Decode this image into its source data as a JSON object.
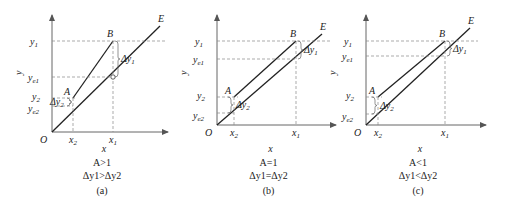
{
  "figure": {
    "panels": [
      {
        "id": "a",
        "origin": [
          52,
          132
        ],
        "axis_top": 15,
        "axis_right": 168,
        "O": [
          52,
          132
        ],
        "A": [
          73,
          98
        ],
        "B": [
          113,
          41
        ],
        "E_end": [
          160,
          26
        ],
        "x2": 73,
        "x1": 113,
        "y1": 41,
        "ye1": 77,
        "y2": 98,
        "ye2": 106,
        "line_AB_separate": true,
        "labels": {
          "y_axis": "y",
          "x_axis": "x",
          "O": "O",
          "A": "A",
          "B": "B",
          "E": "E",
          "y1": "y",
          "y1_sub": "1",
          "ye1": "y",
          "ye1_sub": "e1",
          "y2": "y",
          "y2_sub": "2",
          "ye2": "y",
          "ye2_sub": "e2",
          "x1": "x",
          "x1_sub": "1",
          "x2": "x",
          "x2_sub": "2",
          "dy1": "Δy",
          "dy1_sub": "1",
          "dy2": "Δy",
          "dy2_sub": "2"
        },
        "caption_condition": "A>1",
        "caption_relation": "Δy1>Δy2",
        "caption_tag": "(a)"
      },
      {
        "id": "b",
        "origin": [
          217,
          125
        ],
        "axis_top": 15,
        "axis_right": 336,
        "O": [
          217,
          125
        ],
        "A": [
          234,
          97
        ],
        "B": [
          296,
          41
        ],
        "E_end": [
          322,
          34
        ],
        "x2": 234,
        "x1": 296,
        "y1": 41,
        "ye1": 59,
        "y2": 97,
        "ye2": 113,
        "labels": {
          "y_axis": "y",
          "x_axis": "x",
          "O": "O",
          "A": "A",
          "B": "B",
          "E": "E",
          "y1": "y",
          "y1_sub": "1",
          "ye1": "y",
          "ye1_sub": "e1",
          "y2": "y",
          "y2_sub": "2",
          "ye2": "y",
          "ye2_sub": "e2",
          "x1": "x",
          "x1_sub": "1",
          "x2": "x",
          "x2_sub": "2",
          "dy1": "Δy",
          "dy1_sub": "1",
          "dy2": "Δy",
          "dy2_sub": "2"
        },
        "caption_condition": "A=1",
        "caption_relation": "Δy1=Δy2",
        "caption_tag": "(b)"
      },
      {
        "id": "c",
        "origin": [
          366,
          125
        ],
        "axis_top": 15,
        "axis_right": 486,
        "O": [
          366,
          125
        ],
        "A": [
          378,
          97
        ],
        "B": [
          445,
          41
        ],
        "E_end": [
          470,
          28
        ],
        "x2": 378,
        "x1": 445,
        "y1": 41,
        "ye1": 56,
        "y2": 97,
        "ye2": 114,
        "labels": {
          "y_axis": "y",
          "x_axis": "x",
          "O": "O",
          "A": "A",
          "B": "B",
          "E": "E",
          "y1": "y",
          "y1_sub": "1",
          "ye1": "y",
          "ye1_sub": "e1",
          "y2": "y",
          "y2_sub": "2",
          "ye2": "y",
          "ye2_sub": "e2",
          "x1": "x",
          "x1_sub": "1",
          "x2": "x",
          "x2_sub": "2",
          "dy1": "Δy",
          "dy1_sub": "1",
          "dy2": "Δy",
          "dy2_sub": "2"
        },
        "caption_condition": "A<1",
        "caption_relation": "Δy1<Δy2",
        "caption_tag": "(c)"
      }
    ]
  }
}
